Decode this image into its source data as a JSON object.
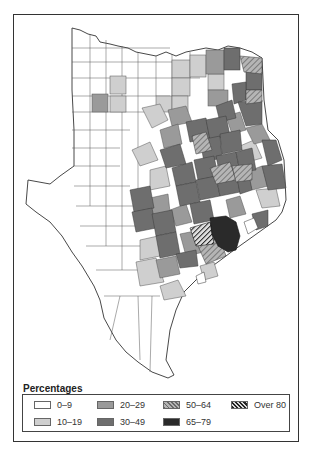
{
  "map": {
    "subject": "Texas counties choropleth",
    "classes": [
      {
        "label": "0–9",
        "fill": "#ffffff",
        "pattern": "solid"
      },
      {
        "label": "10–19",
        "fill": "#cfcfcf",
        "pattern": "solid"
      },
      {
        "label": "20–29",
        "fill": "#9a9a9a",
        "pattern": "solid"
      },
      {
        "label": "30–49",
        "fill": "#6e6e6e",
        "pattern": "solid"
      },
      {
        "label": "50–64",
        "fill": "#a8a8a8",
        "pattern": "light-hatch"
      },
      {
        "label": "65–79",
        "fill": "#2a2a2a",
        "pattern": "solid"
      },
      {
        "label": "Over 80",
        "fill": "#333333",
        "pattern": "dark-hatch"
      }
    ]
  },
  "legend": {
    "title": "Percentages",
    "items": [
      {
        "label": "0–9"
      },
      {
        "label": "10–19"
      },
      {
        "label": "20–29"
      },
      {
        "label": "30–49"
      },
      {
        "label": "50–64"
      },
      {
        "label": "65–79"
      },
      {
        "label": "Over 80"
      }
    ]
  }
}
